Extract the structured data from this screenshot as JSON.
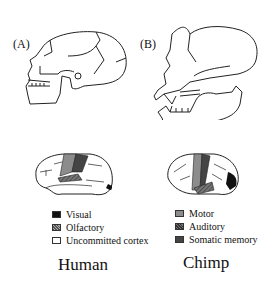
{
  "panels": [
    {
      "label": "(A)",
      "species": "Human"
    },
    {
      "label": "(B)",
      "species": "Chimp"
    }
  ],
  "legend": {
    "left": [
      {
        "label": "Visual",
        "color": "#111111",
        "pattern": "solid"
      },
      {
        "label": "Olfactory",
        "color": "#888888",
        "pattern": "dotted"
      },
      {
        "label": "Uncommitted cortex",
        "color": "#ffffff",
        "pattern": "solid"
      }
    ],
    "right": [
      {
        "label": "Motor",
        "color": "#8c8c8c",
        "pattern": "solid"
      },
      {
        "label": "Auditory",
        "color": "#555555",
        "pattern": "hatched"
      },
      {
        "label": "Somatic memory",
        "color": "#444444",
        "pattern": "solid"
      }
    ]
  }
}
